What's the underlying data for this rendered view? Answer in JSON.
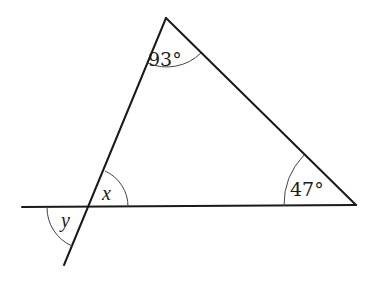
{
  "diagram": {
    "type": "triangle-angles",
    "vertices": {
      "apex": {
        "x": 166,
        "y": 18
      },
      "bottom_right": {
        "x": 356,
        "y": 205
      },
      "bottom_left_intersection": {
        "x": 89,
        "y": 207
      }
    },
    "lines": {
      "baseline": {
        "x1": 22,
        "y1": 207,
        "x2": 356,
        "y2": 205
      },
      "left_side_extended": {
        "x1": 166,
        "y1": 18,
        "x2": 64,
        "y2": 265
      },
      "right_side": {
        "x1": 166,
        "y1": 18,
        "x2": 356,
        "y2": 205
      }
    },
    "labels": {
      "top_angle": "93°",
      "right_angle": "47°",
      "x_angle": "x",
      "y_angle": "y"
    }
  }
}
